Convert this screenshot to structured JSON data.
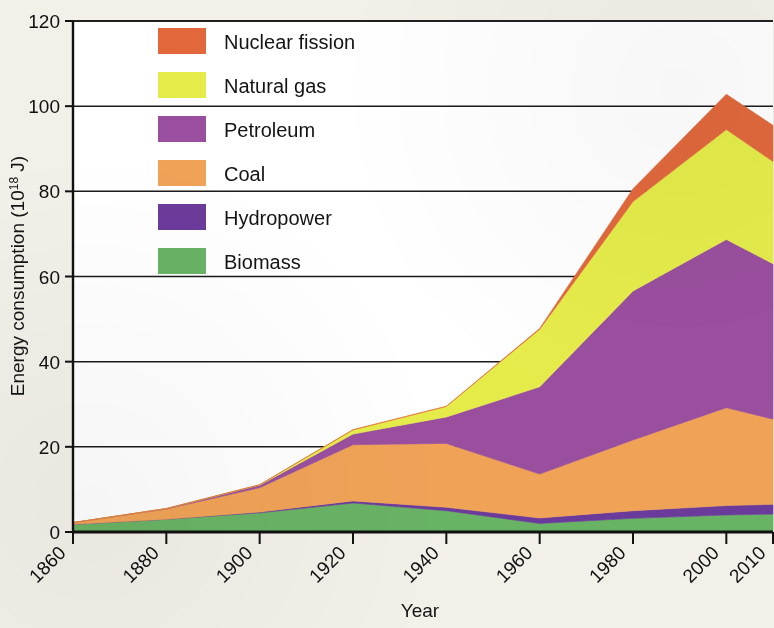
{
  "figure": {
    "background_color": "#f3f0ea",
    "plot_background_color": "#ffffff"
  },
  "axes": {
    "ylabel_prefix": "Energy consumption (10",
    "ylabel_exponent": "18",
    "ylabel_suffix": " J)",
    "ylabel_full": "Energy consumption (10¹⁸ J)",
    "xlabel": "Year",
    "ytick_labels": [
      "0",
      "20",
      "40",
      "60",
      "80",
      "100",
      "120"
    ],
    "xtick_labels": [
      "1860",
      "1880",
      "1900",
      "1920",
      "1940",
      "1960",
      "1980",
      "2000",
      "2010"
    ]
  },
  "legend": {
    "position": "upper-left-inside",
    "entries": [
      {
        "label": "Nuclear fission",
        "color": "#e2683c"
      },
      {
        "label": "Natural gas",
        "color": "#e5ec4a"
      },
      {
        "label": "Petroleum",
        "color": "#9a4f9e"
      },
      {
        "label": "Coal",
        "color": "#f0a357"
      },
      {
        "label": "Hydropower",
        "color": "#6b3b9b"
      },
      {
        "label": "Biomass",
        "color": "#69b365"
      }
    ]
  },
  "chart_data": {
    "type": "area",
    "stacked": true,
    "title": "",
    "xlabel": "Year",
    "ylabel": "Energy consumption (10^18 J)",
    "xlim": [
      1860,
      2010
    ],
    "ylim": [
      0,
      120
    ],
    "grid": "horizontal",
    "legend_position": "upper left (inside axes)",
    "x": [
      1860,
      1880,
      1900,
      1920,
      1940,
      1960,
      1980,
      2000,
      2010
    ],
    "series": [
      {
        "name": "Biomass",
        "color": "#69b365",
        "values": [
          1.8,
          3.0,
          4.5,
          6.8,
          5.0,
          2.0,
          3.2,
          4.0,
          4.2
        ]
      },
      {
        "name": "Hydropower",
        "color": "#6b3b9b",
        "values": [
          0.0,
          0.0,
          0.2,
          0.5,
          0.8,
          1.3,
          1.8,
          2.2,
          2.3
        ]
      },
      {
        "name": "Coal",
        "color": "#f0a357",
        "values": [
          0.4,
          2.4,
          5.7,
          13.2,
          15.0,
          10.3,
          16.6,
          23.0,
          20.0
        ]
      },
      {
        "name": "Petroleum",
        "color": "#9a4f9e",
        "values": [
          0.0,
          0.1,
          0.6,
          2.5,
          6.2,
          20.5,
          35.0,
          39.5,
          36.5
        ]
      },
      {
        "name": "Natural gas",
        "color": "#e5ec4a",
        "values": [
          0.0,
          0.0,
          0.1,
          1.0,
          2.5,
          13.5,
          21.0,
          25.8,
          24.0
        ]
      },
      {
        "name": "Nuclear fission",
        "color": "#e2683c",
        "values": [
          0.0,
          0.0,
          0.0,
          0.0,
          0.0,
          0.2,
          3.0,
          8.3,
          8.5
        ]
      }
    ],
    "totals": [
      2.2,
      5.5,
      11.1,
      24.0,
      29.5,
      47.8,
      80.6,
      102.8,
      95.5
    ]
  }
}
